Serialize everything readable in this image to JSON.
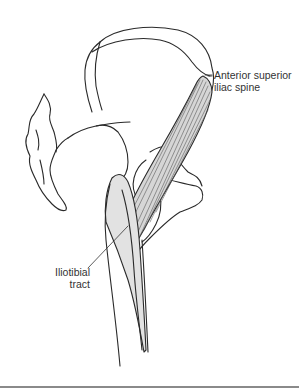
{
  "diagram": {
    "labels": {
      "asis_line1": "Anterior superior",
      "asis_line2": "iliac spine",
      "itt_line1": "Iliotibial",
      "itt_line2": "tract"
    },
    "colors": {
      "outline": "#2a2a2a",
      "muscle_fill": "#d6d6d6",
      "tract_fill": "#e2e2e2",
      "bone_fill": "#ffffff",
      "rule": "#8a8a8a"
    }
  }
}
